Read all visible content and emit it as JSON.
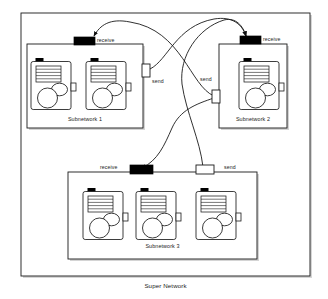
{
  "diagram": {
    "title": "Super Network",
    "type": "network-topology-diagram",
    "outer_container": {
      "label": "Super Network",
      "label_position": "bottom-center"
    },
    "colors": {
      "stroke": "#1a1a1a",
      "receive_port_fill": "#000000",
      "send_port_fill": "#ffffff",
      "box_fill": "#ffffff",
      "shadow": "#9a9a9a",
      "background": "#ffffff"
    },
    "subnetworks": [
      {
        "id": "subnetwork-1",
        "label": "Subnetwork 1",
        "node_count": 2,
        "ports": [
          {
            "kind": "receive",
            "label": "receive",
            "fill": "black",
            "side": "top"
          },
          {
            "kind": "send",
            "label": "send",
            "fill": "white",
            "side": "right"
          }
        ]
      },
      {
        "id": "subnetwork-2",
        "label": "Subnetwork 2",
        "node_count": 1,
        "ports": [
          {
            "kind": "receive",
            "label": "receive",
            "fill": "black",
            "side": "top"
          },
          {
            "kind": "send",
            "label": "send",
            "fill": "white",
            "side": "left"
          }
        ]
      },
      {
        "id": "subnetwork-3",
        "label": "Subnetwork 3",
        "node_count": 3,
        "ports": [
          {
            "kind": "receive",
            "label": "receive",
            "fill": "black",
            "side": "top-left"
          },
          {
            "kind": "send",
            "label": "send",
            "fill": "white",
            "side": "top-right"
          }
        ]
      }
    ],
    "connections": [
      {
        "from": "subnetwork-1.send",
        "to": "subnetwork-2.receive",
        "arrow": true
      },
      {
        "from": "subnetwork-2.send",
        "to": "subnetwork-1.receive",
        "arrow": true
      },
      {
        "from": "subnetwork-2.send",
        "to": "subnetwork-3.receive",
        "arrow": true
      },
      {
        "from": "subnetwork-3.send",
        "to": "subnetwork-2.receive",
        "arrow": true
      }
    ],
    "port_labels": {
      "sn1_receive": "receive",
      "sn1_send": "send",
      "sn2_receive": "receive",
      "sn2_send": "send",
      "sn3_receive": "receive",
      "sn3_send": "send"
    },
    "node_icon": {
      "name": "network-node-icon",
      "parts": [
        "top-tab",
        "body-box",
        "line-list",
        "large-circle",
        "small-ellipse",
        "right-tab"
      ],
      "line_count": 5
    }
  }
}
